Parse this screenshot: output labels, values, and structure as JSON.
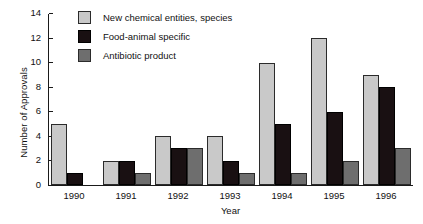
{
  "chart_data": {
    "type": "bar",
    "title": "",
    "xlabel": "Year",
    "ylabel": "Number of Approvals",
    "categories": [
      "1990",
      "1991",
      "1992",
      "1993",
      "1994",
      "1995",
      "1996"
    ],
    "series": [
      {
        "name": "New chemical entities, species",
        "color": "#c9c9c9",
        "values": [
          5,
          2,
          4,
          4,
          10,
          12,
          9
        ]
      },
      {
        "name": "Food-animal specific",
        "color": "#191012",
        "values": [
          1,
          2,
          3,
          2,
          5,
          6,
          8
        ]
      },
      {
        "name": "Antibiotic product",
        "color": "#6e6e6e",
        "values": [
          0,
          1,
          3,
          1,
          1,
          2,
          3
        ]
      }
    ],
    "ylim": [
      0,
      14
    ],
    "yticks": [
      0,
      2,
      4,
      6,
      8,
      10,
      12,
      14
    ],
    "ytick_labels": [
      "0",
      "2",
      "4",
      "6",
      "8",
      "10",
      "12",
      "14"
    ],
    "grid": false,
    "legend_position": "top-left-inside"
  },
  "legend": {
    "items": [
      {
        "label": "New chemical entities, species"
      },
      {
        "label": "Food-animal specific"
      },
      {
        "label": "Antibiotic product"
      }
    ]
  },
  "axes": {
    "y_title": "Number of Approvals",
    "x_title": "Year"
  }
}
